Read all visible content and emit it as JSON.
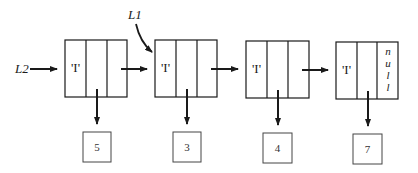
{
  "diagram": {
    "type": "linked-list",
    "pointers": [
      {
        "label": "L2",
        "target_node": 0
      },
      {
        "label": "L1",
        "target_node": 1
      }
    ],
    "nodes": [
      {
        "tag": "'I'",
        "value": "5",
        "next": "arrow"
      },
      {
        "tag": "'I'",
        "value": "3",
        "next": "arrow"
      },
      {
        "tag": "'I'",
        "value": "4",
        "next": "arrow"
      },
      {
        "tag": "'I'",
        "value": "7",
        "next": "null",
        "null_letters": [
          "n",
          "u",
          "l",
          "l"
        ]
      }
    ],
    "colors": {
      "stroke": "#1a1a1a",
      "value_box_stroke": "#444444",
      "background": "#ffffff"
    }
  }
}
